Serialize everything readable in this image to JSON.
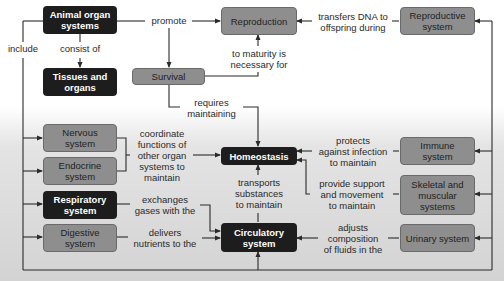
{
  "nodes": {
    "animal_organ_systems": "Animal organ systems",
    "tissues_and_organs": "Tissues and organs",
    "reproduction": "Reproduction",
    "reproductive_system": "Reproductive system",
    "survival": "Survival",
    "homeostasis": "Homeostasis",
    "nervous_system": "Nervous system",
    "endocrine_system": "Endocrine system",
    "respiratory_system": "Respiratory system",
    "digestive_system": "Digestive system",
    "circulatory_system": "Circulatory system",
    "immune_system": "Immune system",
    "skeletal_muscular_systems": "Skeletal and muscular systems",
    "urinary_system": "Urinary system"
  },
  "labels": {
    "include": "include",
    "consist_of": "consist of",
    "promote": "promote",
    "transfers_dna_1": "transfers DNA to",
    "transfers_dna_2": "offspring during",
    "maturity_1": "to maturity is",
    "maturity_2": "necessary for",
    "requires_1": "requires",
    "requires_2": "maintaining",
    "coordinate_1": "coordinate",
    "coordinate_2": "functions of",
    "coordinate_3": "other organ",
    "coordinate_4": "systems to",
    "coordinate_5": "maintain",
    "protects_1": "protects",
    "protects_2": "against infection",
    "protects_3": "to maintain",
    "transports_1": "transports",
    "transports_2": "substances",
    "transports_3": "to maintain",
    "support_1": "provide support",
    "support_2": "and movement",
    "support_3": "to maintain",
    "exchanges_1": "exchanges",
    "exchanges_2": "gases with the",
    "delivers_1": "delivers",
    "delivers_2": "nutrients to the",
    "adjusts_1": "adjusts",
    "adjusts_2": "composition",
    "adjusts_3": "of fluids in the"
  },
  "colors": {
    "dark_node": "#1d1d1d",
    "gray_node": "#8e8e8e",
    "line": "#2a2a2a"
  }
}
